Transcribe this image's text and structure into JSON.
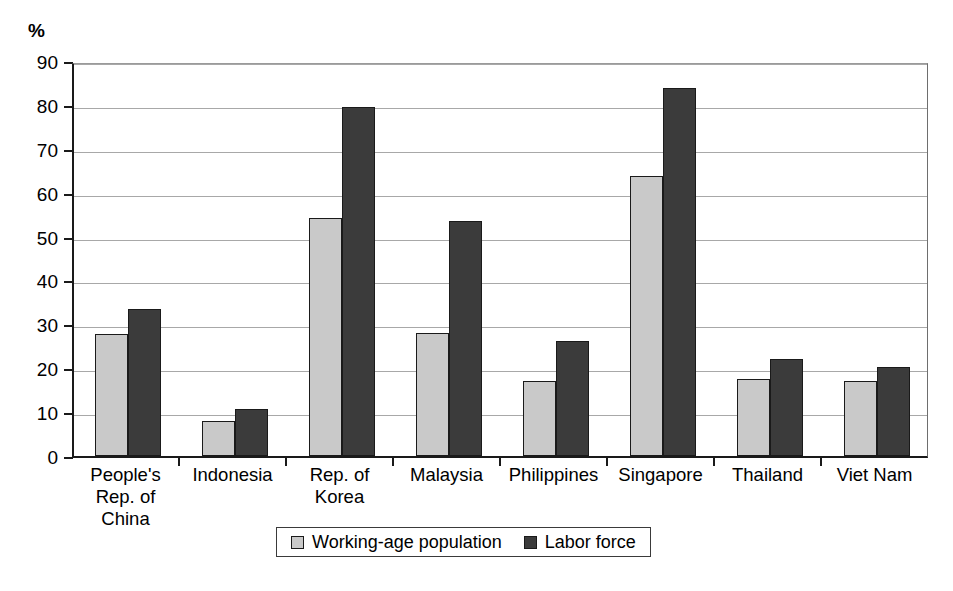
{
  "chart_data": {
    "type": "bar",
    "title": "",
    "subtitle": "",
    "xlabel": "",
    "ylabel": "%",
    "ylim": [
      0,
      90
    ],
    "ytick_step": 10,
    "yticks": [
      "90",
      "80",
      "70",
      "60",
      "50",
      "40",
      "30",
      "20",
      "10",
      "0"
    ],
    "grid": true,
    "legend_position": "bottom-center",
    "categories": [
      "People's Rep. of China",
      "Indonesia",
      "Rep. of Korea",
      "Malaysia",
      "Philippines",
      "Singapore",
      "Thailand",
      "Viet Nam"
    ],
    "category_lines": [
      [
        "People's",
        "Rep. of",
        "China"
      ],
      [
        "Indonesia"
      ],
      [
        "Rep. of",
        "Korea"
      ],
      [
        "Malaysia"
      ],
      [
        "Philippines"
      ],
      [
        "Singapore"
      ],
      [
        "Thailand"
      ],
      [
        "Viet Nam"
      ]
    ],
    "series": [
      {
        "name": "Working-age population",
        "color": "#c9c9c9",
        "values": [
          27.8,
          8.0,
          54.2,
          28.1,
          17.1,
          63.9,
          17.6,
          17.1
        ]
      },
      {
        "name": "Labor force",
        "color": "#3b3b3b",
        "values": [
          33.4,
          10.8,
          79.6,
          53.5,
          26.1,
          83.9,
          22.2,
          20.3
        ]
      }
    ]
  },
  "axis": {
    "unit_label": "%"
  },
  "legend": {
    "entries": [
      {
        "label": "Working-age population",
        "color": "#c9c9c9"
      },
      {
        "label": "Labor force",
        "color": "#3b3b3b"
      }
    ]
  }
}
